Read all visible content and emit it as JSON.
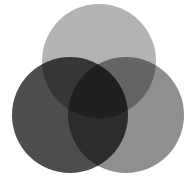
{
  "diagram": {
    "type": "venn",
    "background": "#ffffff",
    "circles": [
      {
        "name": "top",
        "cx": 99,
        "cy": 61,
        "r": 57,
        "color": "#b3b3b3"
      },
      {
        "name": "left",
        "cx": 70,
        "cy": 115,
        "r": 58,
        "color": "#4d4d4d"
      },
      {
        "name": "right",
        "cx": 126,
        "cy": 115,
        "r": 58,
        "color": "#8f8f8f"
      }
    ]
  }
}
